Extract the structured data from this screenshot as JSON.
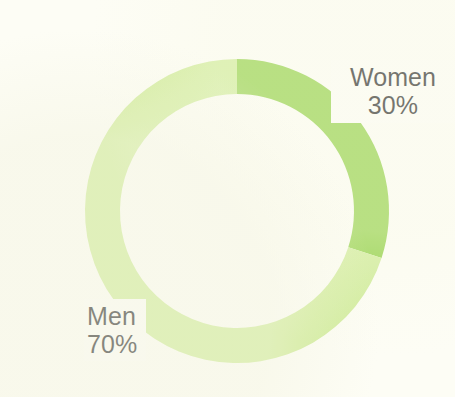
{
  "chart_data": {
    "type": "pie",
    "variant": "donut",
    "title": "",
    "subtitle": "",
    "xlabel": "",
    "ylabel": "",
    "legend_position": "none",
    "grid": false,
    "unit": "%",
    "total": 100,
    "start_angle_deg": 0,
    "direction": "clockwise",
    "inner_radius_px": 117,
    "outer_radius_px": 152,
    "center": {
      "x": 237,
      "y": 211
    },
    "categories": [
      "Women",
      "Men"
    ],
    "values": [
      30,
      70
    ],
    "slices": [
      {
        "label": "Women",
        "value": 30,
        "value_text": "30%",
        "color": "#8cce3c",
        "start_angle_deg": 0,
        "end_angle_deg": 108
      },
      {
        "label": "Men",
        "value": 70,
        "value_text": "70%",
        "color": "#cdeb93",
        "start_angle_deg": 108,
        "end_angle_deg": 360
      }
    ],
    "annotations": [
      {
        "name": "Women",
        "value_text": "30%",
        "position": "right-top"
      },
      {
        "name": "Men",
        "value_text": "70%",
        "position": "left-bottom"
      }
    ]
  },
  "labels": {
    "women": {
      "name": "Women",
      "value": "30%"
    },
    "men": {
      "name": "Men",
      "value": "70%"
    }
  },
  "colors": {
    "background": "#fdfdf5",
    "label_background": "#fdfdf7",
    "text": "#1a1a1a",
    "women_slice": "#8cce3c",
    "men_slice": "#cdeb93"
  }
}
